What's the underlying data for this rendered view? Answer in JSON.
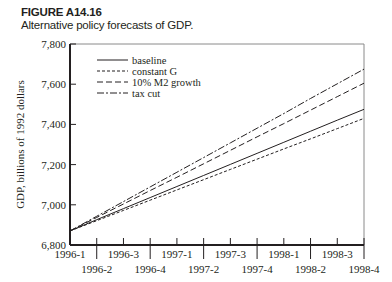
{
  "figure": {
    "label": "FIGURE A14.16",
    "caption": "Alternative policy forecasts of GDP."
  },
  "chart_data": {
    "type": "line",
    "title": "Alternative policy forecasts of GDP.",
    "xlabel": "",
    "ylabel": "GDP, billions of 1992 dollars",
    "ylim": [
      6800,
      7800
    ],
    "yticks": [
      "6,800",
      "7,000",
      "7,200",
      "7,400",
      "7,600",
      "7,800"
    ],
    "x": [
      "1996-1",
      "1996-2",
      "1996-3",
      "1996-4",
      "1997-1",
      "1997-2",
      "1997-3",
      "1997-4",
      "1998-1",
      "1998-2",
      "1998-3",
      "1998-4"
    ],
    "grid": false,
    "legend_position": "upper-left",
    "series": [
      {
        "name": "baseline",
        "style": "solid",
        "values": [
          6870,
          6926,
          6981,
          7036,
          7091,
          7146,
          7201,
          7256,
          7311,
          7366,
          7421,
          7475
        ]
      },
      {
        "name": "constant G",
        "style": "dashed-short",
        "values": [
          6870,
          6921,
          6972,
          7023,
          7074,
          7125,
          7176,
          7227,
          7278,
          7328,
          7379,
          7430
        ]
      },
      {
        "name": "10% M2 growth",
        "style": "dashed-long",
        "values": [
          6870,
          6937,
          7004,
          7071,
          7137,
          7204,
          7271,
          7338,
          7404,
          7471,
          7538,
          7605
        ]
      },
      {
        "name": "tax cut",
        "style": "dash-dot",
        "values": [
          6870,
          6943,
          7016,
          7089,
          7162,
          7235,
          7308,
          7381,
          7454,
          7529,
          7602,
          7675
        ]
      }
    ]
  }
}
